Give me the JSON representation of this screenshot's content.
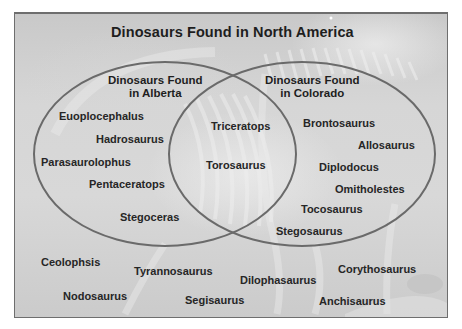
{
  "diagram": {
    "title": "Dinosaurs Found in North America",
    "sets": [
      {
        "name": "alberta",
        "label_line1": "Dinosaurs Found",
        "label_line2": "in Alberta"
      },
      {
        "name": "colorado",
        "label_line1": "Dinosaurs Found",
        "label_line2": "in Colorado"
      }
    ],
    "alberta_only": [
      "Euoplocephalus",
      "Hadrosaurus",
      "Parasaurolophus",
      "Pentaceratops",
      "Stegoceras"
    ],
    "both": [
      "Triceratops",
      "Torosaurus"
    ],
    "colorado_only": [
      "Brontosaurus",
      "Allosaurus",
      "Diplodocus",
      "Omitholestes",
      "Tocosaurus",
      "Stegosaurus"
    ],
    "neither": [
      "Ceolophsis",
      "Tyrannosaurus",
      "Nodosaurus",
      "Segisaurus",
      "Dilophasaurus",
      "Corythosaurus",
      "Anchisaurus"
    ],
    "colors": {
      "circle_stroke": "#6a6a6a",
      "frame_border": "#6e6e6e",
      "text": "#1e1e1e",
      "background": "#d3d3d3"
    }
  }
}
